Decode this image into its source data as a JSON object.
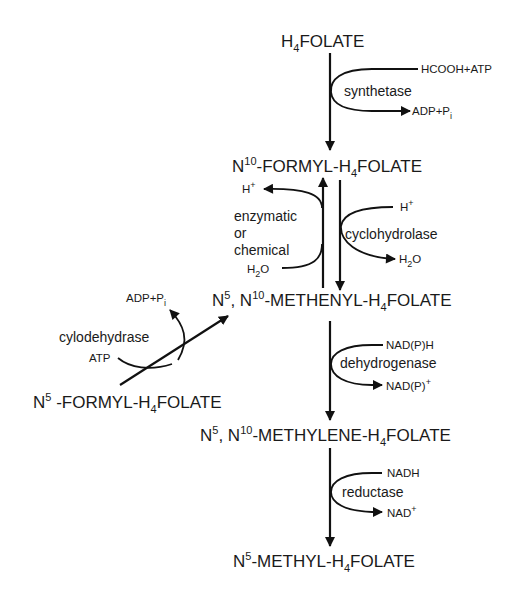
{
  "compounds": {
    "h4folate": {
      "pre": "H",
      "sub": "4",
      "post": "FOLATE"
    },
    "n10_formyl": {
      "a": "N",
      "sup": "10",
      "b": "-FORMYL-H",
      "sub": "4",
      "c": "FOLATE"
    },
    "methenyl": {
      "a": "N",
      "sup1": "5",
      "b": ", N",
      "sup2": "10",
      "c": "-METHENYL-H",
      "sub": "4",
      "d": "FOLATE"
    },
    "n5_formyl": {
      "a": "N",
      "sup": "5",
      "b": " -FORMYL-H",
      "sub": "4",
      "c": "FOLATE"
    },
    "methylene": {
      "a": "N",
      "sup1": "5",
      "b": ", N",
      "sup2": "10",
      "c": "-METHYLENE-H",
      "sub": "4",
      "d": "FOLATE"
    },
    "methyl": {
      "a": "N",
      "sup": "5",
      "b": "-METHYL-H",
      "sub": "4",
      "c": "FOLATE"
    }
  },
  "reactions": {
    "synthetase": {
      "enzyme": "synthetase",
      "input": "HCOOH+ATP",
      "output_main": "ADP+P",
      "output_sub": "i"
    },
    "reverse": {
      "enzyme_line1": "enzymatic",
      "enzyme_line2": "or",
      "enzyme_line3": "chemical",
      "input_main": "H",
      "input_sub": "2",
      "input_post": "O",
      "output_main": "H",
      "output_sup": "+"
    },
    "cyclohydrolase": {
      "enzyme": "cyclohydrolase",
      "input_main": "H",
      "input_sup": "+",
      "output_main": "H",
      "output_sub": "2",
      "output_post": "O"
    },
    "cylodehydrase": {
      "enzyme": "cylodehydrase",
      "input": "ATP",
      "output_main": "ADP+P",
      "output_sub": "i"
    },
    "dehydrogenase": {
      "enzyme": "dehydrogenase",
      "input": "NAD(P)H",
      "output_main": "NAD(P)",
      "output_sup": "+"
    },
    "reductase": {
      "enzyme": "reductase",
      "input": "NADH",
      "output_main": "NAD",
      "output_sup": "+"
    }
  }
}
